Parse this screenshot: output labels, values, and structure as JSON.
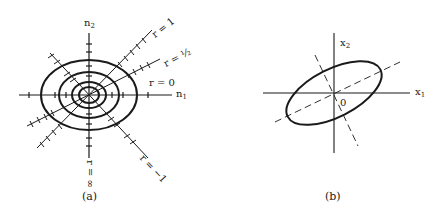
{
  "figure": {
    "panel_a": {
      "caption": "(a)",
      "axis_h_label": "n",
      "axis_h_sub": "1",
      "axis_v_label": "n",
      "axis_v_sub": "2",
      "line_labels": {
        "r_one": "r = 1",
        "r_half": "r = ½",
        "r_zero": "r = 0",
        "r_minus_one": "r = −1",
        "r_infinity": "r = ∞"
      },
      "center": [
        89,
        95
      ],
      "ellipses": [
        {
          "rx": 48,
          "ry": 35
        },
        {
          "rx": 30,
          "ry": 23
        },
        {
          "rx": 17,
          "ry": 13
        },
        {
          "rx": 10,
          "ry": 8
        }
      ]
    },
    "panel_b": {
      "caption": "(b)",
      "axis_h_label": "x",
      "axis_h_sub": "1",
      "axis_v_label": "x",
      "axis_v_sub": "2",
      "origin_label": "0",
      "ellipse": {
        "cx": 114,
        "cy": 93,
        "rx": 52,
        "ry": 24,
        "rotation_deg": -27
      }
    },
    "stroke_color": "#1a1a1a"
  }
}
